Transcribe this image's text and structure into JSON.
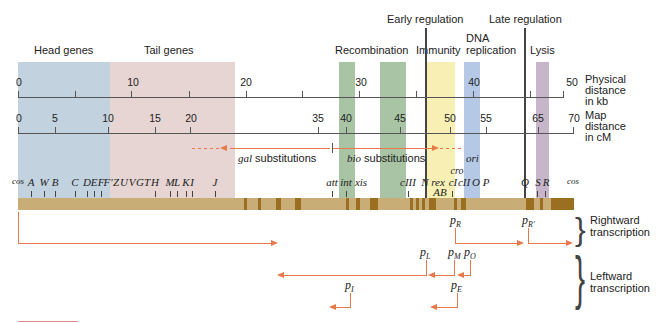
{
  "regions": {
    "head": {
      "label": "Head genes",
      "color": "#c2d2df"
    },
    "tail": {
      "label": "Tail genes",
      "color": "#e6d5d2"
    },
    "recombination": {
      "label": "Recombination",
      "color": "#a9c4a4"
    },
    "early_regulation": {
      "label": "Early regulation"
    },
    "immunity": {
      "label": "Immunity",
      "color": "#f8efb5"
    },
    "dna_replication": {
      "label_line1": "DNA",
      "label_line2": "replication",
      "color": "#b5c9e6"
    },
    "late_regulation": {
      "label": "Late regulation"
    },
    "lysis": {
      "label": "Lysis",
      "color": "#c7b6c9"
    }
  },
  "axes": {
    "physical": {
      "label_line1": "Physical",
      "label_line2": "distance",
      "label_line3": "in kb",
      "ticks": [
        "0",
        "10",
        "20",
        "30",
        "40",
        "50"
      ]
    },
    "map": {
      "label_line1": "Map",
      "label_line2": "distance",
      "label_line3": "in cM",
      "ticks": [
        "0",
        "5",
        "10",
        "15",
        "20",
        "35",
        "40",
        "45",
        "50",
        "55",
        "65",
        "70"
      ]
    }
  },
  "substitutions": {
    "gal": {
      "italic": "gal",
      "text": " substitutions"
    },
    "bio": {
      "italic": "bio",
      "text": " substitutions"
    },
    "ori": "ori"
  },
  "genes": [
    "cos",
    "A",
    "W",
    "B",
    "C",
    "D",
    "E",
    "F",
    "F'",
    "Z",
    "U",
    "V",
    "G",
    "T",
    "H",
    "M",
    "L",
    "K",
    "I",
    "J",
    "att",
    "int",
    "xis",
    "cIII",
    "N",
    "rex",
    "AB",
    "cI",
    "cro",
    "cII",
    "O",
    "P",
    "Q",
    "S",
    "R",
    "cos"
  ],
  "promoters": {
    "pR": {
      "p": "p",
      "sub": "R"
    },
    "pR2": {
      "p": "p",
      "sub": "R′"
    },
    "pL": {
      "p": "p",
      "sub": "L"
    },
    "pM": {
      "p": "p",
      "sub": "M"
    },
    "pO": {
      "p": "p",
      "sub": "O"
    },
    "pI": {
      "p": "p",
      "sub": "I"
    },
    "pE": {
      "p": "p",
      "sub": "E"
    }
  },
  "transcription": {
    "rightward_line1": "Rightward",
    "rightward_line2": "transcription",
    "leftward_line1": "Leftward",
    "leftward_line2": "transcription"
  },
  "colors": {
    "arrow": "#e8794b",
    "track": "#c9ad76",
    "track_dark": "#9a6f22"
  }
}
